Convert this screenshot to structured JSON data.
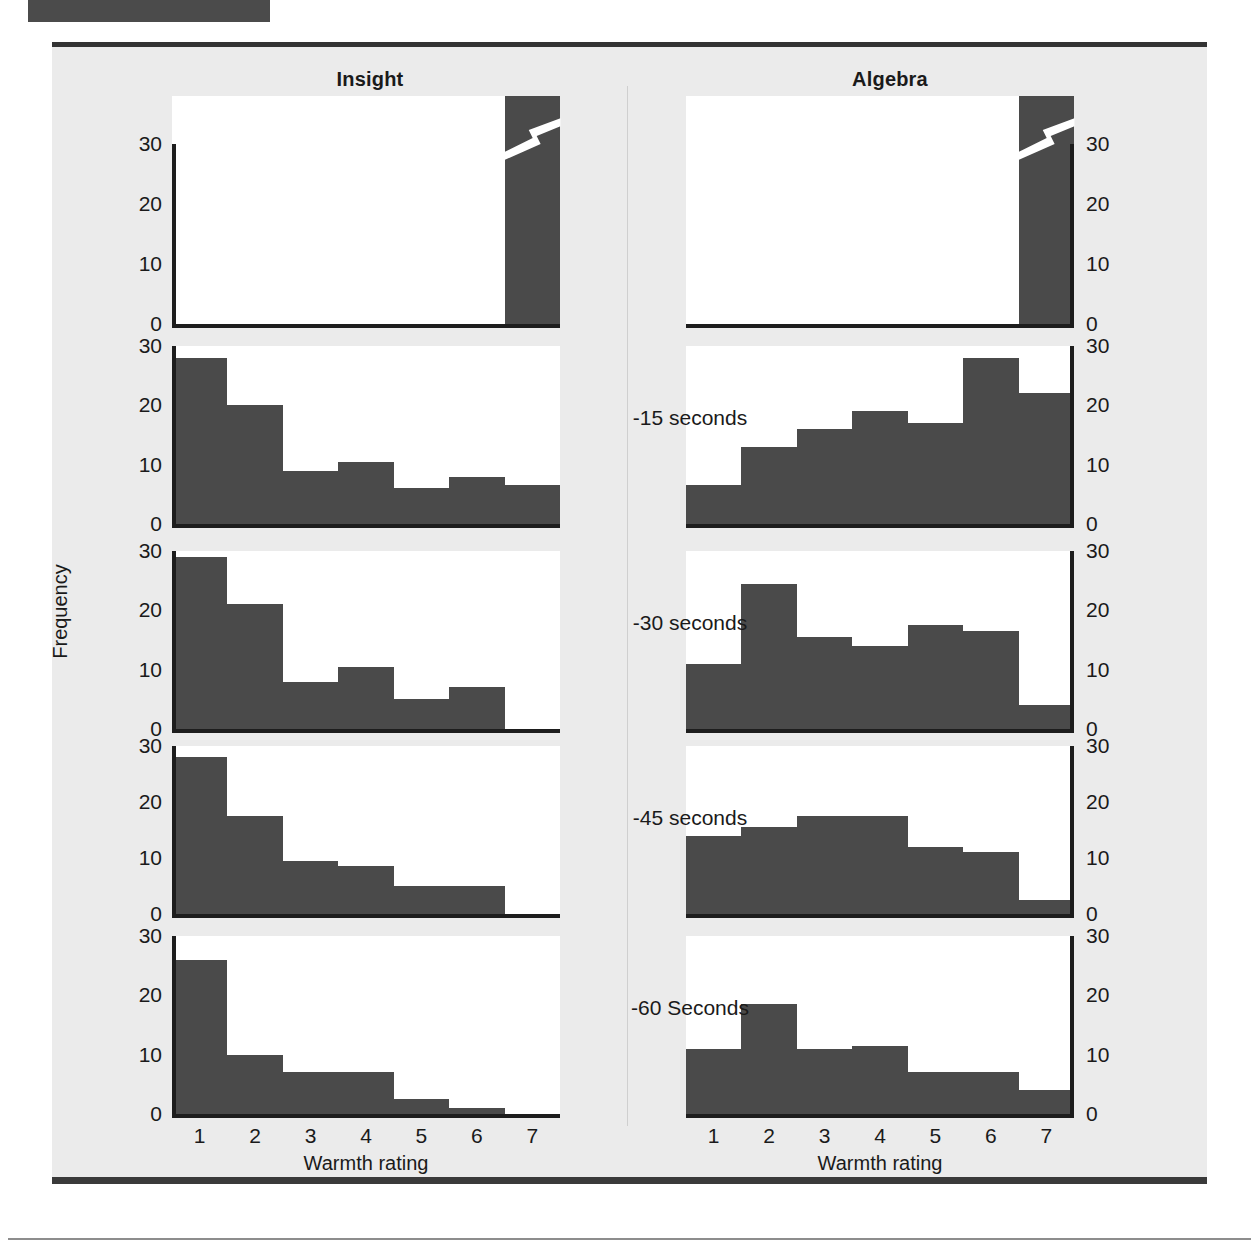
{
  "figure": {
    "column_titles": [
      "Insight",
      "Algebra"
    ],
    "y_axis_title": "Frequency",
    "x_axis_title": "Warmth rating",
    "x_tick_labels": [
      "1",
      "2",
      "3",
      "4",
      "5",
      "6",
      "7"
    ],
    "y_tick_labels": [
      "30",
      "20",
      "10",
      "0"
    ],
    "row_labels": [
      "-15 seconds",
      "-30 seconds",
      "-45 seconds",
      "-60 Seconds"
    ],
    "bar_color": "#4a4a4a",
    "axis_color": "#1d1d1d",
    "panel_background": "#ffffff",
    "figure_background": "#ebebeb",
    "break_marker": "axis-break-zigzag"
  },
  "chart_data": {
    "type": "bar",
    "xlabel": "Warmth rating",
    "ylabel": "Frequency",
    "categories": [
      "1",
      "2",
      "3",
      "4",
      "5",
      "6",
      "7"
    ],
    "ylim": [
      0,
      30
    ],
    "grid": false,
    "legend": "none",
    "layout": "5 rows x 2 columns of panels; top row is an axis-broken panel showing only the very tall rating-7 bar",
    "panels": [
      {
        "row": "solution moment (axis broken)",
        "row_label": "",
        "axis_broken": true,
        "series": [
          {
            "name": "Insight",
            "values": [
              0,
              0,
              0,
              0,
              0,
              0,
              38
            ]
          },
          {
            "name": "Algebra",
            "values": [
              0,
              0,
              0,
              0,
              0,
              0,
              38
            ]
          }
        ]
      },
      {
        "row": "-15 seconds",
        "row_label": "-15 seconds",
        "axis_broken": false,
        "series": [
          {
            "name": "Insight",
            "values": [
              28,
              20,
              9,
              10.5,
              6,
              8,
              6.5
            ]
          },
          {
            "name": "Algebra",
            "values": [
              6.5,
              13,
              16,
              19,
              17,
              28,
              22
            ]
          }
        ]
      },
      {
        "row": "-30 seconds",
        "row_label": "-30 seconds",
        "axis_broken": false,
        "series": [
          {
            "name": "Insight",
            "values": [
              29,
              21,
              8,
              10.5,
              5,
              7,
              0
            ]
          },
          {
            "name": "Algebra",
            "values": [
              11,
              24.5,
              15.5,
              14,
              17.5,
              16.5,
              4
            ]
          }
        ]
      },
      {
        "row": "-45 seconds",
        "row_label": "-45 seconds",
        "axis_broken": false,
        "series": [
          {
            "name": "Insight",
            "values": [
              28,
              17.5,
              9.5,
              8.5,
              5,
              5,
              0
            ]
          },
          {
            "name": "Algebra",
            "values": [
              14,
              15.5,
              17.5,
              17.5,
              12,
              11,
              2.5
            ]
          }
        ]
      },
      {
        "row": "-60 Seconds",
        "row_label": "-60 Seconds",
        "axis_broken": false,
        "series": [
          {
            "name": "Insight",
            "values": [
              26,
              10,
              7,
              7,
              2.5,
              1,
              0
            ]
          },
          {
            "name": "Algebra",
            "values": [
              11,
              18.5,
              11,
              11.5,
              7,
              7,
              4
            ]
          }
        ]
      }
    ]
  }
}
